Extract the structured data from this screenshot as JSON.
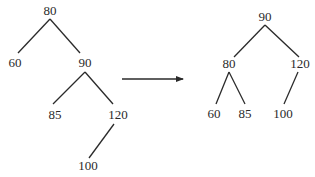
{
  "diagram": {
    "type": "tree-rotation",
    "before": {
      "nodes": [
        {
          "id": "b80",
          "label": "80",
          "x": 50,
          "y": 15
        },
        {
          "id": "b60",
          "label": "60",
          "x": 15,
          "y": 67
        },
        {
          "id": "b90",
          "label": "90",
          "x": 85,
          "y": 67
        },
        {
          "id": "b85",
          "label": "85",
          "x": 55,
          "y": 119
        },
        {
          "id": "b120",
          "label": "120",
          "x": 118,
          "y": 119
        },
        {
          "id": "b100",
          "label": "100",
          "x": 88,
          "y": 170
        }
      ],
      "edges": [
        {
          "x1": 50,
          "y1": 19,
          "x2": 18,
          "y2": 53
        },
        {
          "x1": 50,
          "y1": 19,
          "x2": 80,
          "y2": 53
        },
        {
          "x1": 85,
          "y1": 72,
          "x2": 53,
          "y2": 104
        },
        {
          "x1": 85,
          "y1": 72,
          "x2": 113,
          "y2": 104
        },
        {
          "x1": 114,
          "y1": 124,
          "x2": 89,
          "y2": 158
        }
      ]
    },
    "arrow": {
      "x1": 122,
      "y1": 79,
      "x2": 183,
      "y2": 79
    },
    "after": {
      "nodes": [
        {
          "id": "a90",
          "label": "90",
          "x": 265,
          "y": 21
        },
        {
          "id": "a80",
          "label": "80",
          "x": 229,
          "y": 68
        },
        {
          "id": "a120",
          "label": "120",
          "x": 300,
          "y": 68
        },
        {
          "id": "a60",
          "label": "60",
          "x": 214,
          "y": 118
        },
        {
          "id": "a85",
          "label": "85",
          "x": 245,
          "y": 118
        },
        {
          "id": "a100",
          "label": "100",
          "x": 283,
          "y": 118
        }
      ],
      "edges": [
        {
          "x1": 265,
          "y1": 25,
          "x2": 234,
          "y2": 57
        },
        {
          "x1": 265,
          "y1": 25,
          "x2": 299,
          "y2": 57
        },
        {
          "x1": 229,
          "y1": 72,
          "x2": 216,
          "y2": 104
        },
        {
          "x1": 229,
          "y1": 72,
          "x2": 245,
          "y2": 104
        },
        {
          "x1": 298,
          "y1": 72,
          "x2": 284,
          "y2": 104
        }
      ]
    }
  }
}
